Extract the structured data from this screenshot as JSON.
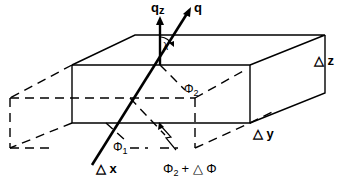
{
  "diagram": {
    "type": "3d-box-geometry",
    "labels": {
      "qz": "q",
      "qz_sub": "z",
      "q": "q",
      "lambda": "λ",
      "phi2": "Φ",
      "phi2_sub": "2",
      "phi1": "Φ",
      "phi1_sub": "1",
      "phi2_plus": "Φ",
      "phi2_plus_sub": "2",
      "phi2_plus_rest": "+ △ Φ",
      "delta_x": "△ x",
      "delta_y": "△ y",
      "delta_z": "△ z"
    },
    "colors": {
      "stroke": "#000000",
      "background": "#ffffff"
    }
  }
}
